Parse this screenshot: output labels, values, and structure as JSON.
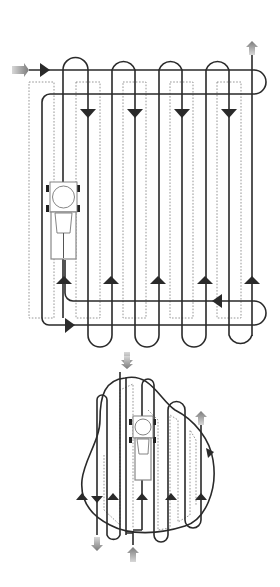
{
  "diagram": {
    "colors": {
      "path": "#2a2a2a",
      "guide": "#8a8a8a",
      "entry_exit_arrow": "#8c8c8c",
      "background": "#ffffff"
    },
    "panels": [
      {
        "name": "rectangular-field",
        "pattern": "alternating loop passes with headland turns",
        "passes": 10
      },
      {
        "name": "irregular-field",
        "pattern": "parallel passes inside curved boundary",
        "passes": 8
      }
    ],
    "icons": [
      "tractor-icon",
      "entry-arrow-icon",
      "exit-arrow-icon",
      "direction-arrow-icon"
    ]
  }
}
